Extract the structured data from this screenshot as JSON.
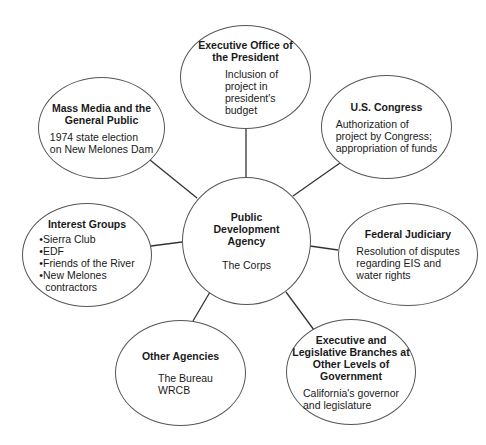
{
  "diagram": {
    "center": {
      "title": "Public Development Agency",
      "body": "The Corps"
    },
    "nodes": [
      {
        "id": "executive-office",
        "title": "Executive Office of the President",
        "body": [
          "Inclusion of",
          "project in",
          "president's",
          "budget"
        ]
      },
      {
        "id": "us-congress",
        "title": "U.S. Congress",
        "body": [
          "Authorization of",
          "project by Congress;",
          "appropriation of funds"
        ]
      },
      {
        "id": "federal-judiciary",
        "title": "Federal Judiciary",
        "body": [
          "Resolution of disputes",
          "regarding EIS and",
          "water rights"
        ]
      },
      {
        "id": "other-levels-government",
        "title": "Executive and Legislative Branches at Other Levels of Government",
        "body": [
          "California's governor",
          "and legislature"
        ]
      },
      {
        "id": "other-agencies",
        "title": "Other Agencies",
        "body": [
          "The Bureau",
          "WRCB"
        ]
      },
      {
        "id": "interest-groups",
        "title": "Interest Groups",
        "bullets": [
          "Sierra Club",
          "EDF",
          "Friends of the River",
          "New Melones"
        ],
        "bullet_continuation": "contractors"
      },
      {
        "id": "mass-media",
        "title": "Mass Media and the General Public",
        "body": [
          "1974 state election",
          "on New Melones Dam"
        ]
      }
    ],
    "colors": {
      "stroke": "#555555",
      "line": "#333333",
      "text": "#1a1a1a",
      "background": "#ffffff"
    }
  }
}
